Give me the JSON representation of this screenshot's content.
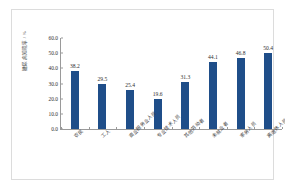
{
  "chart_data": {
    "type": "bar",
    "title": "",
    "xlabel": "",
    "ylabel": "糖尿病知晓率 / %",
    "ylim": [
      0,
      60
    ],
    "grid": false,
    "legend": false,
    "bar_color": "#1F4E89",
    "categories": [
      "农民",
      "工人",
      "商业服务业人员",
      "专业技术人员",
      "其他劳动者",
      "未就业者",
      "家务人员",
      "离退休人员"
    ],
    "values": [
      38.2,
      29.5,
      25.4,
      19.6,
      31.3,
      44.1,
      46.8,
      50.4
    ],
    "data_labels": [
      "38.2",
      "29.5",
      "25.4",
      "19.6",
      "31.3",
      "44.1",
      "46.8",
      "50.4"
    ],
    "ytick_labels": [
      "0.0",
      "10.0",
      "20.0",
      "30.0",
      "40.0",
      "50.0",
      "60.0"
    ],
    "ytick_values": [
      0,
      10,
      20,
      30,
      40,
      50,
      60
    ]
  },
  "figure": {
    "background_color": "#FFFFFF",
    "frame_color": "#DCDCDC",
    "axis_color": "#9A9A9A"
  }
}
